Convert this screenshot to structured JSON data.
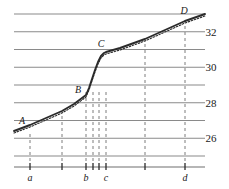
{
  "chart_data": {
    "type": "line",
    "title": "",
    "xlabel": "",
    "ylabel": "",
    "grid": true,
    "legend": false,
    "xlim": [
      0,
      229
    ],
    "ylim": [
      24.6,
      33.6
    ],
    "y_gridlines": [
      25.0,
      26.0,
      27.0,
      28.0,
      29.0,
      30.0,
      31.0,
      32.0,
      33.0
    ],
    "y_tick_labels": [
      {
        "value": 32,
        "text": "32"
      },
      {
        "value": 30,
        "text": "30"
      },
      {
        "value": 28,
        "text": "28"
      },
      {
        "value": 26,
        "text": "26"
      }
    ],
    "x_ticks": [
      {
        "x": 30,
        "label": "a"
      },
      {
        "x": 62,
        "label": ""
      },
      {
        "x": 86,
        "label": "b"
      },
      {
        "x": 93,
        "label": ""
      },
      {
        "x": 99,
        "label": ""
      },
      {
        "x": 106,
        "label": "c"
      },
      {
        "x": 145,
        "label": ""
      },
      {
        "x": 185,
        "label": "d"
      }
    ],
    "dashed_verticals": [
      30,
      62,
      86,
      93,
      99,
      106,
      145,
      185
    ],
    "point_labels": [
      {
        "id": "A",
        "text": "A",
        "x": 22,
        "y": 124
      },
      {
        "id": "B",
        "text": "B",
        "x": 78,
        "y": 93
      },
      {
        "id": "C",
        "text": "C",
        "x": 101,
        "y": 47
      },
      {
        "id": "D",
        "text": "D",
        "x": 184,
        "y": 14
      }
    ],
    "series": [
      {
        "name": "measured",
        "style": "solid",
        "points": [
          [
            14,
            131
          ],
          [
            30,
            125
          ],
          [
            46,
            118
          ],
          [
            62,
            111
          ],
          [
            74,
            104
          ],
          [
            82,
            98
          ],
          [
            86,
            95
          ],
          [
            89,
            88
          ],
          [
            92,
            79
          ],
          [
            95,
            70
          ],
          [
            98,
            62
          ],
          [
            101,
            56
          ],
          [
            104,
            53
          ],
          [
            106,
            52
          ],
          [
            120,
            48
          ],
          [
            145,
            39
          ],
          [
            165,
            30
          ],
          [
            185,
            21
          ],
          [
            205,
            14
          ]
        ]
      },
      {
        "name": "fitted",
        "style": "dotted",
        "points": [
          [
            14,
            133
          ],
          [
            30,
            127
          ],
          [
            46,
            120
          ],
          [
            62,
            113
          ],
          [
            74,
            106
          ],
          [
            82,
            100
          ],
          [
            86,
            97
          ],
          [
            89,
            90
          ],
          [
            92,
            81
          ],
          [
            95,
            72
          ],
          [
            98,
            64
          ],
          [
            101,
            58
          ],
          [
            104,
            55
          ],
          [
            106,
            54
          ],
          [
            120,
            50
          ],
          [
            145,
            41
          ],
          [
            165,
            32
          ],
          [
            185,
            23
          ],
          [
            205,
            16
          ]
        ]
      }
    ],
    "axis_line": {
      "y": 167,
      "x_start": 14,
      "x_end": 205
    },
    "grid_extent": {
      "x_start": 14,
      "x_end": 205
    },
    "colors": {
      "gridline": "#8a8a8a",
      "curve": "#2b2b2b",
      "dashed": "#7d7d7d",
      "axis": "#6f6f6f",
      "text": "#1a1a1a"
    }
  }
}
